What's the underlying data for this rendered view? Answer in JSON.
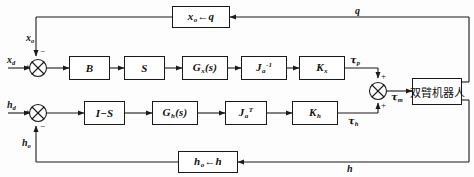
{
  "diagram": {
    "line_color": "#1a1a1a",
    "blocks": {
      "b": "B",
      "s": "S",
      "gx": "G",
      "gx_sub": "x",
      "gx_arg": "(s)",
      "ja_inv": "J",
      "ja_inv_sub": "a",
      "ja_inv_sup": "-1",
      "kx": "K",
      "kx_sub": "x",
      "i_minus_s": "I−S",
      "gh": "G",
      "gh_sub": "h",
      "gh_arg": "(s)",
      "ja_t": "J",
      "ja_t_sub": "a",
      "ja_t_sup": "T",
      "kh": "K",
      "kh_sub": "h",
      "plant": "双臂机器人",
      "fb_top_left": "x",
      "fb_top_left_sub": "o",
      "fb_top_arrow": "←",
      "fb_top_right": "q",
      "fb_bot_left": "h",
      "fb_bot_left_sub": "o",
      "fb_bot_arrow": "←",
      "fb_bot_right": "h"
    },
    "labels": {
      "x_d": "x",
      "x_d_sub": "d",
      "x_o": "x",
      "x_o_sub": "o",
      "h_d": "h",
      "h_d_sub": "d",
      "h_o": "h",
      "h_o_sub": "o",
      "tau_p": "τ",
      "tau_p_sub": "p",
      "tau_h": "τ",
      "tau_h_sub": "h",
      "tau_m": "τ",
      "tau_m_sub": "m",
      "q": "q",
      "h": "h"
    },
    "signs": {
      "sum1_plus": "+",
      "sum1_minus": "−",
      "sum2_plus": "+",
      "sum2_minus": "−",
      "sum3_plus_top": "+",
      "sum3_plus_bottom": "+"
    }
  }
}
